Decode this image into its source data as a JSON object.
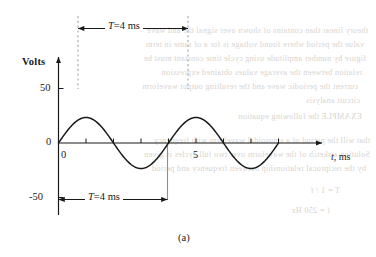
{
  "figure": {
    "caption": "(a)",
    "ylabel": "Volts",
    "xlabel_italic": "t",
    "xlabel_rest": ", ms",
    "dimension_top": {
      "symbol": "T",
      "equals": "=",
      "value": "4 ms"
    },
    "dimension_bottom": {
      "symbol": "T",
      "equals": "=",
      "value": "4 ms"
    },
    "y_ticks": [
      "50",
      "0",
      "-50"
    ],
    "x_ticks": [
      "0",
      "5"
    ],
    "colors": {
      "curve": "#1a1a1a",
      "axis": "#1a1a1a",
      "guide_dashed": "#a8a8a8",
      "guide_solid": "#8f8f8f",
      "background": "#ffffff",
      "bleed_text": "#d8d4cf"
    }
  },
  "chart_data": {
    "type": "line",
    "title": "",
    "subtitle": "",
    "xlabel": "t, ms",
    "ylabel": "Volts",
    "xlim": [
      0,
      8.6
    ],
    "ylim": [
      -62,
      62
    ],
    "grid": false,
    "legend": null,
    "waveform": {
      "shape": "sine",
      "amplitude": 50,
      "period_ms": 4,
      "frequency_hz": 250,
      "phase_deg": 0,
      "expression": "50 sin(2*pi*t/4)",
      "x_start": 0,
      "x_end": 8
    },
    "x_tick_values": [
      0,
      1,
      2,
      3,
      4,
      5,
      6,
      7,
      8
    ],
    "x_tick_labels": [
      "0",
      "",
      "",
      "",
      "",
      "5",
      "",
      "",
      ""
    ],
    "y_tick_values": [
      50,
      0,
      -50
    ],
    "y_tick_labels": [
      "50",
      "0",
      "-50"
    ],
    "series": [
      {
        "name": "v(t)",
        "x": [
          0,
          0.25,
          0.5,
          0.75,
          1,
          1.25,
          1.5,
          1.75,
          2,
          2.25,
          2.5,
          2.75,
          3,
          3.25,
          3.5,
          3.75,
          4,
          4.25,
          4.5,
          4.75,
          5,
          5.25,
          5.5,
          5.75,
          6,
          6.25,
          6.5,
          6.75,
          7,
          7.25,
          7.5,
          7.75,
          8
        ],
        "y": [
          0,
          19.1,
          35.4,
          46.2,
          50,
          46.2,
          35.4,
          19.1,
          0,
          -19.1,
          -35.4,
          -46.2,
          -50,
          -46.2,
          -35.4,
          -19.1,
          0,
          19.1,
          35.4,
          46.2,
          50,
          46.2,
          35.4,
          19.1,
          0,
          -19.1,
          -35.4,
          -46.2,
          -50,
          -46.2,
          -35.4,
          -19.1,
          0
        ]
      }
    ],
    "annotations": [
      {
        "text": "T = 4 ms",
        "type": "dimension",
        "from_x": 1,
        "to_x": 5,
        "position": "above-plot",
        "note": "peak-to-peak period measured between positive peaks"
      },
      {
        "text": "T = 4 ms",
        "type": "dimension",
        "from_x": 0,
        "to_x": 4,
        "position": "below-plot",
        "note": "period measured between zero crossings"
      }
    ],
    "guide_lines": [
      {
        "x": 1,
        "style": "dashed",
        "color": "#a8a8a8"
      },
      {
        "x": 5,
        "style": "dashed",
        "color": "#a8a8a8"
      },
      {
        "x": 4,
        "style": "solid",
        "color": "#8f8f8f"
      }
    ]
  },
  "bleed_through": {
    "visible": true,
    "note": "faint mirrored text from reverse side of page"
  }
}
